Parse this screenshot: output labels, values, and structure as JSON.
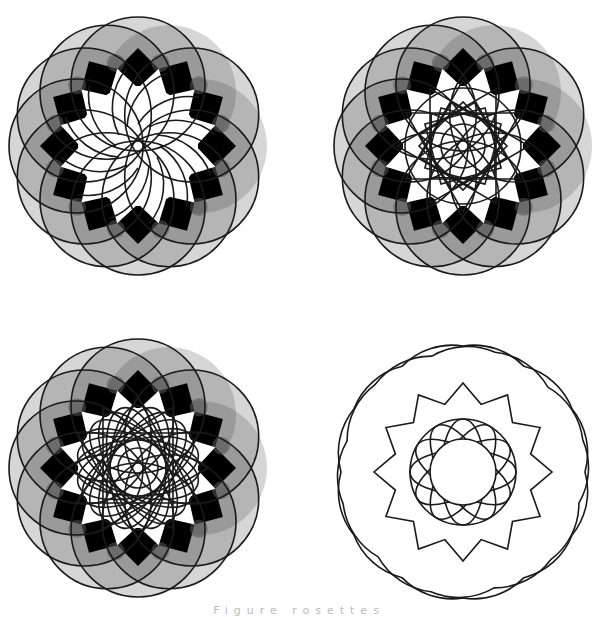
{
  "figure": {
    "width": 598,
    "height": 612,
    "background": "#ffffff",
    "stroke_color": "#1a1a1a",
    "fill_color": "#333333",
    "dark_color": "#000000",
    "light_color": "#ffffff"
  },
  "rosettes": [
    {
      "id": "rosette-1",
      "cx": 138,
      "cy": 146,
      "circle_count": 12,
      "circle_offset": 62,
      "circle_radius": 67,
      "fill_opacity": 0.2,
      "dark_ring": true,
      "inner_style": "swirl",
      "inner_radius": 72
    },
    {
      "id": "rosette-2",
      "cx": 463,
      "cy": 146,
      "circle_count": 12,
      "circle_offset": 62,
      "circle_radius": 67,
      "fill_opacity": 0.2,
      "dark_ring": true,
      "inner_style": "star-squares",
      "inner_radius": 72
    },
    {
      "id": "rosette-3",
      "cx": 138,
      "cy": 468,
      "circle_count": 12,
      "circle_offset": 62,
      "circle_radius": 67,
      "fill_opacity": 0.2,
      "dark_ring": true,
      "inner_style": "dense-ellipses",
      "inner_radius": 72
    },
    {
      "id": "rosette-4",
      "cx": 463,
      "cy": 472,
      "inner_style": "outline-only",
      "outer_radius": 126,
      "star_tip_radius": 89,
      "star_notch_radius": 70,
      "core_radius": 53,
      "hole_radius": 33
    }
  ],
  "caption": {
    "text": "Figure rosettes"
  }
}
